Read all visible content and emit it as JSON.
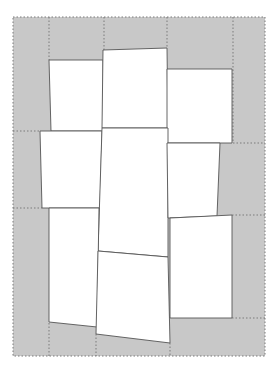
{
  "diagram": {
    "title": "",
    "background": "#ffffff",
    "board": {
      "x": 13,
      "y": 17,
      "width": 252,
      "height": 339,
      "fill": "#c8c8c8",
      "border_color": "#7a7a7a",
      "border_style": "dotted"
    },
    "grid_lines": [
      {
        "x1": 49,
        "y1": 17,
        "x2": 49,
        "y2": 60
      },
      {
        "x1": 104,
        "y1": 17,
        "x2": 104,
        "y2": 50
      },
      {
        "x1": 167,
        "y1": 17,
        "x2": 167,
        "y2": 48
      },
      {
        "x1": 233,
        "y1": 17,
        "x2": 233,
        "y2": 143
      },
      {
        "x1": 13,
        "y1": 131,
        "x2": 40,
        "y2": 131
      },
      {
        "x1": 233,
        "y1": 143,
        "x2": 265,
        "y2": 143
      },
      {
        "x1": 13,
        "y1": 208,
        "x2": 42,
        "y2": 208
      },
      {
        "x1": 232,
        "y1": 215,
        "x2": 265,
        "y2": 215
      },
      {
        "x1": 232,
        "y1": 318,
        "x2": 265,
        "y2": 318
      },
      {
        "x1": 49,
        "y1": 323,
        "x2": 49,
        "y2": 356
      },
      {
        "x1": 96,
        "y1": 334,
        "x2": 96,
        "y2": 356
      },
      {
        "x1": 170,
        "y1": 343,
        "x2": 170,
        "y2": 356
      }
    ],
    "pieces": [
      {
        "name": "piece-a",
        "points": "49,60 103,60 103,131 51,131"
      },
      {
        "name": "piece-b",
        "points": "103,50 167,48 168,128 102,128"
      },
      {
        "name": "piece-c",
        "points": "167,69 232,69 232,143 167,143"
      },
      {
        "name": "piece-d",
        "points": "40,131 102,131 100,208 42,208"
      },
      {
        "name": "piece-e",
        "points": "102,128 168,128 168,257 98,251"
      },
      {
        "name": "piece-f",
        "points": "167,143 220,143 217,216 168,218"
      },
      {
        "name": "piece-g",
        "points": "49,208 99,208 97,327 49,322"
      },
      {
        "name": "piece-h",
        "points": "98,251 168,257 170,343 96,334"
      },
      {
        "name": "piece-i",
        "points": "170,218 232,215 232,318 170,318"
      }
    ],
    "piece_fill": "#ffffff",
    "piece_stroke": "#555555"
  }
}
